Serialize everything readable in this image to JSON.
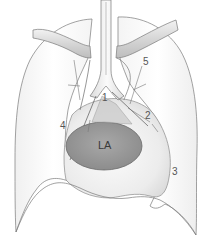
{
  "diagram": {
    "type": "anatomical-chest-illustration",
    "structures": {
      "left_atrium": {
        "label": "LA",
        "fill": "#9a9a9a"
      },
      "lungs": {
        "fill": "#fafafa",
        "stroke": "#7a7a7a"
      },
      "heart": {
        "fill": "#ececec"
      },
      "clavicles": {
        "fill": "#dcdcdc"
      },
      "trachea": {
        "fill": "#eeeeee"
      }
    },
    "labels": [
      {
        "id": "1",
        "text": "1"
      },
      {
        "id": "2",
        "text": "2"
      },
      {
        "id": "3",
        "text": "3"
      },
      {
        "id": "4",
        "text": "4"
      },
      {
        "id": "5",
        "text": "5"
      }
    ]
  }
}
